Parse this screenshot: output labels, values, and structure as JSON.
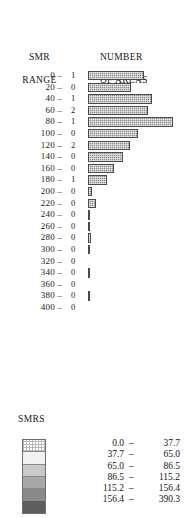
{
  "headers": {
    "smr_range_line1": "SMR",
    "smr_range_line2": "RANGE",
    "number_line1": "NUMBER",
    "number_line2": "OF AREAS"
  },
  "legend": {
    "title": "SMRS",
    "dash": "–",
    "classes": [
      {
        "low": "0.0",
        "high": "37.7",
        "color": "#ffffff"
      },
      {
        "low": "37.7",
        "high": "65.0",
        "color": "#f2f2f2"
      },
      {
        "low": "65.0",
        "high": "86.5",
        "color": "#c9c9c9"
      },
      {
        "low": "86.5",
        "high": "115.2",
        "color": "#a8a8a8"
      },
      {
        "low": "115.2",
        "high": "156.4",
        "color": "#8a8a8a"
      },
      {
        "low": "156.4",
        "high": "390.3",
        "color": "#5e5e5e"
      }
    ]
  },
  "chart_data": {
    "type": "bar",
    "title": "",
    "orientation": "horizontal",
    "xlabel": "NUMBER OF AREAS",
    "ylabel": "SMR RANGE",
    "grid": false,
    "legend_position": "bottom-left",
    "bar_color": "#8e8e8e",
    "categories": [
      "0",
      "20",
      "40",
      "60",
      "80",
      "100",
      "120",
      "140",
      "160",
      "180",
      "200",
      "220",
      "240",
      "260",
      "280",
      "300",
      "320",
      "340",
      "360",
      "380",
      "400"
    ],
    "tick_labels": [
      "0 –",
      "20 –",
      "40 –",
      "60 –",
      "80 –",
      "100 –",
      "120 –",
      "140 –",
      "160 –",
      "180 –",
      "200 –",
      "220 –",
      "240 –",
      "260 –",
      "280 –",
      "300 –",
      "320 –",
      "340 –",
      "360 –",
      "380 –",
      "400 –"
    ],
    "count_labels": [
      "1",
      "0",
      "1",
      "2",
      "1",
      "0",
      "2",
      "0",
      "0",
      "1",
      "0",
      "0",
      "0",
      "0",
      "0",
      "0",
      "0",
      "0",
      "0",
      "0",
      "0"
    ],
    "values": [
      56,
      43,
      64,
      60,
      85,
      50,
      42,
      35,
      26,
      19,
      4,
      8,
      1,
      2,
      3,
      2,
      0,
      1,
      0,
      1,
      0
    ],
    "xlim": [
      0,
      90
    ],
    "rows": [
      {
        "label": "0 –",
        "count": "1",
        "bar": 56
      },
      {
        "label": "20 –",
        "count": "0",
        "bar": 43
      },
      {
        "label": "40 –",
        "count": "1",
        "bar": 64
      },
      {
        "label": "60 –",
        "count": "2",
        "bar": 60
      },
      {
        "label": "80 –",
        "count": "1",
        "bar": 85
      },
      {
        "label": "100 –",
        "count": "0",
        "bar": 50
      },
      {
        "label": "120 –",
        "count": "2",
        "bar": 42
      },
      {
        "label": "140 –",
        "count": "0",
        "bar": 35
      },
      {
        "label": "160 –",
        "count": "0",
        "bar": 26
      },
      {
        "label": "180 –",
        "count": "1",
        "bar": 19
      },
      {
        "label": "200 –",
        "count": "0",
        "bar": 4
      },
      {
        "label": "220 –",
        "count": "0",
        "bar": 8
      },
      {
        "label": "240 –",
        "count": "0",
        "bar": 1
      },
      {
        "label": "260 –",
        "count": "0",
        "bar": 2
      },
      {
        "label": "280 –",
        "count": "0",
        "bar": 3
      },
      {
        "label": "300 –",
        "count": "0",
        "bar": 2
      },
      {
        "label": "320 –",
        "count": "0",
        "bar": 0
      },
      {
        "label": "340 –",
        "count": "0",
        "bar": 1
      },
      {
        "label": "360 –",
        "count": "0",
        "bar": 0
      },
      {
        "label": "380 –",
        "count": "0",
        "bar": 1
      },
      {
        "label": "400 –",
        "count": "0",
        "bar": 0
      }
    ]
  }
}
